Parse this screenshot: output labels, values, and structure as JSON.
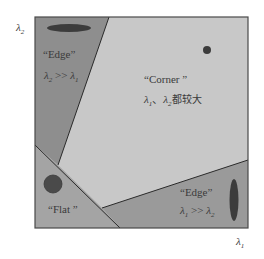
{
  "axes": {
    "y_label": "λ",
    "y_label_sub": "2",
    "x_label": "λ",
    "x_label_sub": "1"
  },
  "regions": {
    "edge_top": {
      "title": "“Edge”",
      "rel_lambda_a": "λ",
      "rel_sub_a": "2",
      "rel_op": " >> ",
      "rel_lambda_b": "λ",
      "rel_sub_b": "1",
      "fill": "#8e8e8e"
    },
    "corner": {
      "title": "“Corner ”",
      "rel_lambda_a": "λ",
      "rel_sub_a": "1",
      "rel_sep": "、",
      "rel_lambda_b": "λ",
      "rel_sub_b": "2",
      "rel_suffix": "都较大",
      "fill": "#c8c8c8"
    },
    "flat": {
      "title": "“Flat ”",
      "fill": "#a4a4a4"
    },
    "edge_bottom": {
      "title": "“Edge”",
      "rel_lambda_a": "λ",
      "rel_sub_a": "1",
      "rel_op": " >> ",
      "rel_lambda_b": "λ",
      "rel_sub_b": "2",
      "fill": "#9a9a9a"
    }
  },
  "colors": {
    "border": "#4a4a4a",
    "divider": "#2a2a2a",
    "ellipse": "#3c3c3c"
  }
}
